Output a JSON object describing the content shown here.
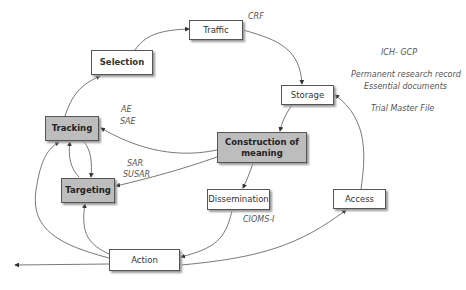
{
  "nodes": {
    "traffic": "Traffic",
    "selection": "Selection",
    "storage": "Storage",
    "tracking": "Tracking",
    "construction": "Construction of meaning",
    "targeting": "Targeting",
    "dissemination": "Dissemination",
    "access": "Access",
    "action": "Action"
  },
  "labels": {
    "crf": "CRF",
    "ich_gcp": "ICH- GCP",
    "permanent_record": "Permanent research record",
    "essential_docs": "Essential documents",
    "tmf": "Trial Master File",
    "ae": "AE",
    "sae": "SAE",
    "sar": "SAR",
    "susar": "SUSAR",
    "cioms": "CIOMS-I"
  },
  "colors": {
    "highlight_box": "#bdbdbd",
    "edge": "#444444"
  }
}
